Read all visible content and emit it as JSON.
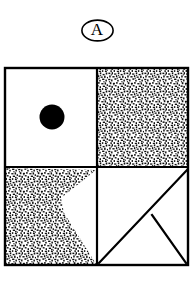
{
  "figure": {
    "panel_label": "A",
    "panel_label_shape": "ellipse-outline",
    "colors": {
      "ink": "#000000",
      "background": "#ffffff",
      "stipple": "#1a1a1a"
    },
    "frame": {
      "x": 5,
      "y": 68,
      "width": 183,
      "height": 197,
      "stroke_width": 2.2
    },
    "divider": {
      "vertical_x": 97,
      "horizontal_y": 167,
      "stroke_width": 2.2
    },
    "quadrants": [
      {
        "name": "top-left",
        "fill": "white",
        "content": "filled-black-circle",
        "circle": {
          "cx": 52,
          "cy": 117,
          "r": 12.5,
          "fill": "#000000"
        }
      },
      {
        "name": "top-right",
        "fill": "stipple-texture",
        "content": "full-stipple-fill",
        "coverage_percent": 100
      },
      {
        "name": "bottom-left",
        "fill": "stipple-texture",
        "content": "notched-polygon-stipple",
        "coverage_percent": 62,
        "polygon_points": "5,168 5,264 96,264 64,213 61,198 96,170"
      },
      {
        "name": "bottom-right",
        "fill": "white",
        "content": "triangle-outline-with-apex",
        "lines": [
          {
            "from": [
              188,
              170
            ],
            "to": [
              99,
              263
            ]
          },
          {
            "from": [
              152,
              215
            ],
            "to": [
              187,
              263
            ]
          }
        ]
      }
    ]
  },
  "icons": {
    "panel-label-ellipse": "ellipse-outline-icon"
  }
}
